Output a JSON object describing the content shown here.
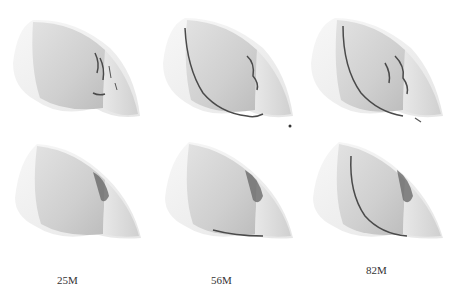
{
  "figure": {
    "columns": [
      {
        "label": "25M"
      },
      {
        "label": "56M"
      },
      {
        "label": "82M"
      }
    ],
    "rows": [
      "top",
      "bottom"
    ],
    "colors": {
      "background": "#ffffff",
      "surface_light": "#f2f2f2",
      "surface_mid": "#d4d4d4",
      "surface_dark": "#b8b8b8",
      "crack_lines": "#4a4a4a"
    }
  }
}
